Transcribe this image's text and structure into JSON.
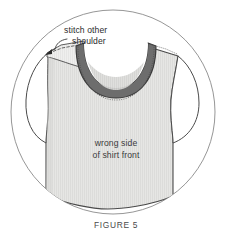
{
  "figure": {
    "caption": "FIGURE 5",
    "annotations": {
      "callout_line1": "stitch other",
      "callout_line2": "shoulder",
      "label_line1": "wrong side",
      "label_line2": "of shirt front"
    },
    "icons": {
      "callout_arrow": "curved-arrow-icon",
      "circle_frame": "circle-frame-icon",
      "shirt": "shirt-illustration-icon",
      "collar": "collar-band-icon",
      "shoulder_flap": "shoulder-flap-icon",
      "stitch_line_left": "dashed-stitch-line-icon",
      "stitch_line_collar": "dotted-stitch-line-icon"
    },
    "colors": {
      "background": "#ffffff",
      "circle_stroke": "#8a8a8a",
      "shirt_fill": "#e3e3e1",
      "shirt_stroke": "#4a4a4a",
      "collar_fill": "#6d6d6d",
      "collar_stroke": "#3c3c3c",
      "collar_inner_fill": "#d8d8d6",
      "flap_fill": "#ececeb",
      "stitch_color": "#555555",
      "text_color": "#2b2b2b",
      "caption_color": "#4a4a4a"
    }
  }
}
